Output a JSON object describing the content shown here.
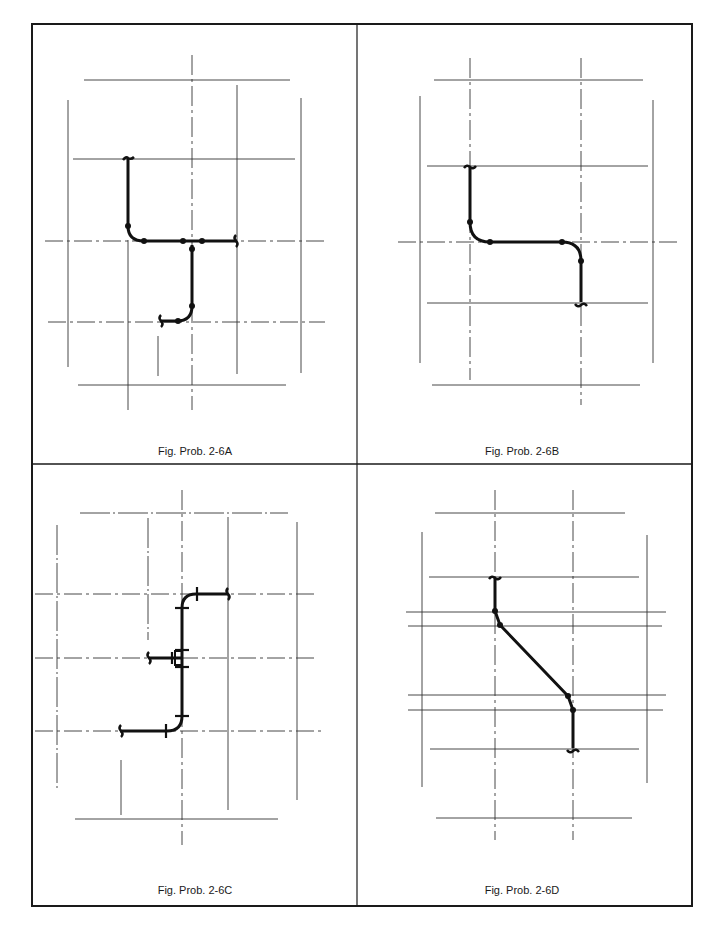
{
  "page": {
    "header_text": "",
    "panels": [
      {
        "id": "A",
        "caption": "Fig. Prob. 2-6A"
      },
      {
        "id": "B",
        "caption": "Fig. Prob. 2-6B"
      },
      {
        "id": "C",
        "caption": "Fig. Prob. 2-6C"
      },
      {
        "id": "D",
        "caption": "Fig. Prob. 2-6D"
      }
    ]
  },
  "colors": {
    "ink": "#1a1a1a",
    "grid": "#333333",
    "paper": "#ffffff"
  }
}
